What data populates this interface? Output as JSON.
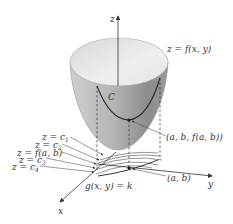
{
  "figure": {
    "axes": {
      "z_label": "z",
      "y_label": "y",
      "x_label": "x"
    },
    "surface_label": "z = f(x, y)",
    "curve_label": "C",
    "point_3d_label": "(a, b, f(a, b))",
    "point_2d_label": "(a, b)",
    "constraint_label": "g(x, y) = k",
    "level_labels": [
      {
        "prefix": "z = c",
        "sub": "1"
      },
      {
        "prefix": "z = c",
        "sub": "2"
      },
      {
        "prefix": "z = f(a, b)",
        "sub": ""
      },
      {
        "prefix": "z = c",
        "sub": "3"
      },
      {
        "prefix": "z = c",
        "sub": "4"
      }
    ],
    "colors": {
      "surface_light": "#e6e6e6",
      "surface_dark": "#8a8a8a",
      "lines": "#333333",
      "curve": "#2a2a2a"
    }
  }
}
